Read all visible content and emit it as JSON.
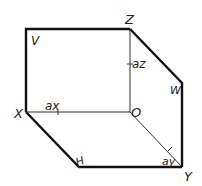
{
  "diagram": {
    "labels": {
      "Z": "Z",
      "V": "V",
      "az": "az",
      "W": "W",
      "X": "X",
      "ax": "ax",
      "O": "O",
      "H": "H",
      "ay": "ay",
      "Y": "Y"
    },
    "colors": {
      "line": "#111111",
      "text": "#222222"
    }
  }
}
